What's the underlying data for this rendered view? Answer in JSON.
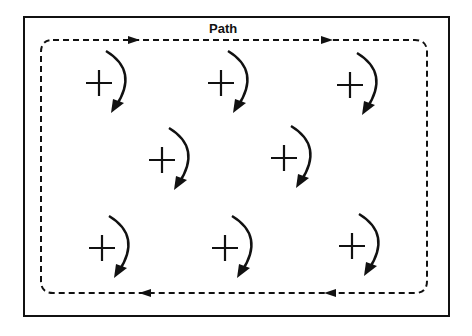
{
  "diagram": {
    "path_label": "Path",
    "colors": {
      "stroke": "#111111",
      "background": "#ffffff"
    },
    "charges": [
      {
        "symbol": "+",
        "x": 99,
        "y": 83,
        "rotation": "clockwise"
      },
      {
        "symbol": "+",
        "x": 221,
        "y": 83,
        "rotation": "clockwise"
      },
      {
        "symbol": "+",
        "x": 350,
        "y": 85,
        "rotation": "clockwise"
      },
      {
        "symbol": "+",
        "x": 162,
        "y": 160,
        "rotation": "clockwise"
      },
      {
        "symbol": "+",
        "x": 284,
        "y": 158,
        "rotation": "clockwise"
      },
      {
        "symbol": "+",
        "x": 102,
        "y": 248,
        "rotation": "clockwise"
      },
      {
        "symbol": "+",
        "x": 225,
        "y": 248,
        "rotation": "clockwise"
      },
      {
        "symbol": "+",
        "x": 352,
        "y": 246,
        "rotation": "clockwise"
      }
    ],
    "path_direction": "clockwise"
  }
}
